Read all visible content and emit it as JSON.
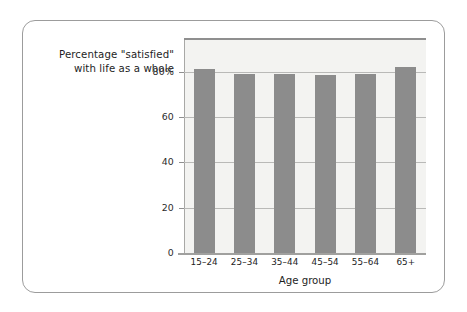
{
  "chart_data": {
    "type": "bar",
    "title": "Percentage \"satisfied\"\nwith life as a whole",
    "xlabel": "Age group",
    "ylabel": "",
    "categories": [
      "15–24",
      "25–34",
      "35–44",
      "45–54",
      "55–64",
      "65+"
    ],
    "values": [
      81,
      79,
      79,
      78.5,
      79,
      82
    ],
    "ylim": [
      0,
      94
    ],
    "yticks": [
      0,
      20,
      40,
      60,
      80
    ],
    "ytick_labels": [
      "0",
      "20",
      "40",
      "60",
      "80%"
    ],
    "grid": true,
    "legend": "none",
    "bar_color": "#8c8c8c",
    "plot_background": "#f3f3f1",
    "gridline_color": "#b9b9b7",
    "axis_color": "#8f8f8f",
    "frame_color": "#9c9c9c"
  }
}
